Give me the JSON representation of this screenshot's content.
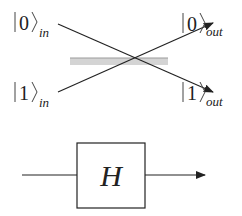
{
  "beam_splitter_diagram": {
    "inputs": [
      {
        "state": "0",
        "subscript": "in"
      },
      {
        "state": "1",
        "subscript": "in"
      }
    ],
    "outputs": [
      {
        "state": "0",
        "subscript": "out"
      },
      {
        "state": "1",
        "subscript": "out"
      }
    ],
    "splitter_color": "#d4d4d4"
  },
  "gate_diagram": {
    "gate_label": "H"
  }
}
